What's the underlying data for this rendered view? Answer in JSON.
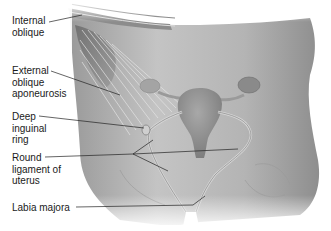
{
  "diagram": {
    "labels": [
      {
        "id": "internal-oblique",
        "lines": [
          "Internal",
          "oblique"
        ]
      },
      {
        "id": "external-oblique-aponeurosis",
        "lines": [
          "External",
          "oblique",
          "aponeurosis"
        ]
      },
      {
        "id": "deep-inguinal-ring",
        "lines": [
          "Deep",
          "inguinal",
          "ring"
        ]
      },
      {
        "id": "round-ligament-of-uterus",
        "lines": [
          "Round",
          "ligament of",
          "uterus"
        ]
      },
      {
        "id": "labia-majora",
        "lines": [
          "Labia majora"
        ]
      }
    ],
    "colors": {
      "background": "#ffffff",
      "body_dark": "#8a8a8a",
      "body_mid": "#b0b0b0",
      "body_light": "#d8d8d8",
      "leader_line": "#222222",
      "label_text": "#1a1a1a"
    }
  }
}
